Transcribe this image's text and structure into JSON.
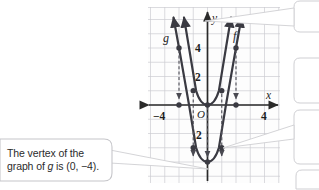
{
  "figure": {
    "type": "coordinate-graph",
    "background": "#ffffff",
    "grid_color": "#c9c9cf",
    "grid_bg": "#fdfdfd",
    "axis_color": "#2a2a2a",
    "curve_color": "#3a3a42",
    "callout_fill": "#ffffff",
    "callout_stroke": "#b9b9bd"
  },
  "axes": {
    "x_label": "x",
    "y_label": "y",
    "origin_label": "O",
    "x_ticks": [
      {
        "value": -4,
        "label": "−4"
      },
      {
        "value": 4,
        "label": "4"
      }
    ],
    "y_ticks": [
      {
        "value": 4,
        "label": "4"
      },
      {
        "value": 2,
        "label": "2"
      },
      {
        "value": -2,
        "label": "2"
      }
    ],
    "xlim": [
      -5,
      5
    ],
    "ylim": [
      -5.5,
      5.5
    ]
  },
  "curves": [
    {
      "name": "f",
      "label": "f",
      "equation_hint": "y = x^2",
      "vertex": [
        0,
        0
      ],
      "points": [
        [
          -2,
          4
        ],
        [
          -1,
          1
        ],
        [
          0,
          0
        ],
        [
          1,
          1
        ],
        [
          2,
          4
        ]
      ]
    },
    {
      "name": "g",
      "label": "g",
      "equation_hint": "y = x^2 - 4",
      "vertex": [
        0,
        -4
      ],
      "points": [
        [
          -2,
          0
        ],
        [
          -1,
          -3
        ],
        [
          0,
          -4
        ],
        [
          1,
          -3
        ],
        [
          2,
          0
        ]
      ]
    }
  ],
  "translation_arrows": [
    {
      "from": [
        -2,
        4
      ],
      "to": [
        -2,
        0
      ],
      "style": "dashed",
      "direction": "down"
    },
    {
      "from": [
        -1,
        1
      ],
      "to": [
        -1,
        -3
      ],
      "style": "dashed",
      "direction": "down"
    },
    {
      "from": [
        0,
        0
      ],
      "to": [
        0,
        -4
      ],
      "style": "dashed",
      "direction": "down"
    },
    {
      "from": [
        1,
        1
      ],
      "to": [
        1,
        -3
      ],
      "style": "dashed",
      "direction": "down"
    },
    {
      "from": [
        2,
        4
      ],
      "to": [
        2,
        0
      ],
      "style": "dashed",
      "direction": "down"
    }
  ],
  "callouts": [
    {
      "id": "vertex-callout",
      "line1": "The vertex of the",
      "line2_pre": "graph of ",
      "line2_ital": "g",
      "line2_post": " is (0, −4)."
    }
  ]
}
